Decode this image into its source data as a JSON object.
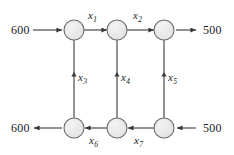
{
  "diagram": {
    "type": "network-flow-graph",
    "title": "",
    "stroke_color": "#3a3a3a",
    "node_fill": "#e8e8e8",
    "text_color": "#1a1a1a",
    "nodes": [
      {
        "id": "n1",
        "name": "node-top-left",
        "cx": 74,
        "cy": 30
      },
      {
        "id": "n2",
        "name": "node-top-middle",
        "cx": 117,
        "cy": 30
      },
      {
        "id": "n3",
        "name": "node-top-right",
        "cx": 164,
        "cy": 30
      },
      {
        "id": "n4",
        "name": "node-bottom-left",
        "cx": 74,
        "cy": 128
      },
      {
        "id": "n5",
        "name": "node-bottom-middle",
        "cx": 117,
        "cy": 128
      },
      {
        "id": "n6",
        "name": "node-bottom-right",
        "cx": 164,
        "cy": 128
      }
    ],
    "node_radius": 10,
    "internal_edges": [
      {
        "id": "e1",
        "label": "x",
        "sub": "1",
        "from": "n1",
        "to": "n2",
        "direction": "right",
        "label_x": 88,
        "label_y": 9
      },
      {
        "id": "e2",
        "label": "x",
        "sub": "2",
        "from": "n2",
        "to": "n3",
        "direction": "right",
        "label_x": 133,
        "label_y": 9
      },
      {
        "id": "e3",
        "label": "x",
        "sub": "3",
        "from": "n4",
        "to": "n1",
        "direction": "up",
        "label_x": 78,
        "label_y": 72
      },
      {
        "id": "e4",
        "label": "x",
        "sub": "4",
        "from": "n5",
        "to": "n2",
        "direction": "up",
        "label_x": 121,
        "label_y": 72
      },
      {
        "id": "e5",
        "label": "x",
        "sub": "5",
        "from": "n6",
        "to": "n3",
        "direction": "up",
        "label_x": 168,
        "label_y": 72
      },
      {
        "id": "e6",
        "label": "x",
        "sub": "6",
        "from": "n5",
        "to": "n4",
        "direction": "left",
        "label_x": 89,
        "label_y": 136
      },
      {
        "id": "e7",
        "label": "x",
        "sub": "7",
        "from": "n6",
        "to": "n5",
        "direction": "left",
        "label_x": 134,
        "label_y": 136
      }
    ],
    "external_flows": [
      {
        "id": "f1",
        "name": "supply-top-left",
        "value": "600",
        "label_x": 11,
        "label_y": 23,
        "direction": "into-network"
      },
      {
        "id": "f2",
        "name": "demand-top-right",
        "value": "500",
        "label_x": 203,
        "label_y": 23,
        "direction": "out-of-network"
      },
      {
        "id": "f3",
        "name": "demand-bottom-left",
        "value": "600",
        "label_x": 11,
        "label_y": 121,
        "direction": "out-of-network"
      },
      {
        "id": "f4",
        "name": "supply-bottom-right",
        "value": "500",
        "label_x": 203,
        "label_y": 121,
        "direction": "into-network"
      }
    ]
  }
}
